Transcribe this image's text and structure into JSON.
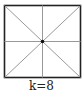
{
  "figure": {
    "label": "k=8",
    "rays": 8,
    "colors": {
      "border": "#222222",
      "ray": "#888888",
      "center": "#111111"
    }
  }
}
